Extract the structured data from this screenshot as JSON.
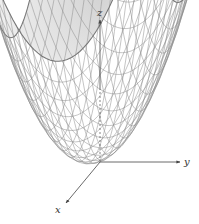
{
  "figure": {
    "surface": {
      "equation": "z = x^2 + y^2",
      "type": "paraboloid",
      "grid_lines": 22,
      "line_color": "#8a8a8a",
      "edge_color": "#777777",
      "fill_top": "#f4f4f4",
      "fill_bottom": "#d8d8d8"
    },
    "axes": {
      "x": {
        "label": "x"
      },
      "y": {
        "label": "y"
      },
      "z": {
        "label": "z"
      },
      "color": "#555555"
    }
  }
}
